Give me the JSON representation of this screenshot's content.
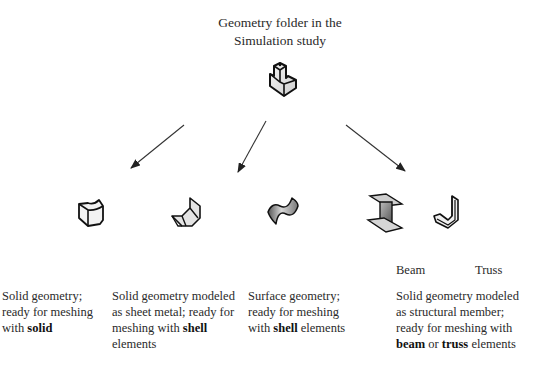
{
  "root": {
    "title_line1": "Geometry folder in the",
    "title_line2": "Simulation study",
    "icon": "geometry-folder-part-icon"
  },
  "branches": [
    {
      "id": "solid",
      "icon": "solid-body-icon",
      "caption": [
        {
          "text": "Solid geometry;"
        },
        {
          "text": "ready for meshing"
        },
        {
          "text": "with ",
          "bold": "solid"
        }
      ]
    },
    {
      "id": "sheet-metal",
      "icon": "sheet-metal-icon",
      "caption": [
        {
          "text": "Solid geometry modeled"
        },
        {
          "text": "as sheet metal; ready for"
        },
        {
          "text": "meshing with ",
          "bold": "shell"
        },
        {
          "text": "elements"
        }
      ]
    },
    {
      "id": "surface",
      "icon": "surface-body-icon",
      "caption": [
        {
          "text": "Surface geometry;"
        },
        {
          "text": "ready for meshing"
        },
        {
          "text": "with ",
          "bold": "shell",
          "after": " elements"
        }
      ]
    },
    {
      "id": "structural",
      "icons": [
        {
          "name": "beam-icon",
          "label": "Beam"
        },
        {
          "name": "truss-icon",
          "label": "Truss"
        }
      ],
      "caption": [
        {
          "text": "Solid geometry modeled"
        },
        {
          "text": "as structural member;"
        },
        {
          "text": "ready for meshing with"
        },
        {
          "bold": "beam",
          "middle": " or ",
          "bold2": "truss",
          "after": " elements"
        }
      ]
    }
  ],
  "arrows": [
    {
      "from": [
        184,
        125
      ],
      "to": [
        131,
        168
      ]
    },
    {
      "from": [
        266,
        121
      ],
      "to": [
        238,
        172
      ]
    },
    {
      "from": [
        346,
        125
      ],
      "to": [
        405,
        171
      ]
    }
  ],
  "colors": {
    "line": "#2a2a2a",
    "background": "#ffffff"
  }
}
